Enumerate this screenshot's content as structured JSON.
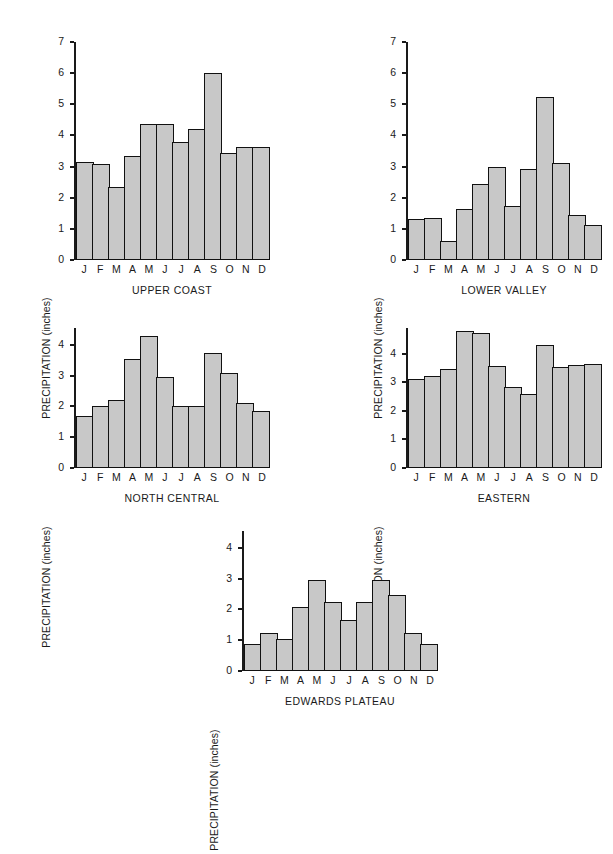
{
  "figure": {
    "ylabel": "PRECIPITATION (inches)",
    "months": [
      "J",
      "F",
      "M",
      "A",
      "M",
      "J",
      "J",
      "A",
      "S",
      "O",
      "N",
      "D"
    ],
    "bar_fill": "#c8c8c8",
    "bar_stroke": "#111111",
    "background": "#ffffff"
  },
  "chart_data": [
    {
      "type": "bar",
      "title": "UPPER COAST",
      "xlabel": "",
      "ylabel": "PRECIPITATION (inches)",
      "categories": [
        "J",
        "F",
        "M",
        "A",
        "M",
        "J",
        "J",
        "A",
        "S",
        "O",
        "N",
        "D"
      ],
      "values": [
        3.15,
        3.08,
        2.33,
        3.33,
        4.38,
        4.38,
        3.78,
        4.2,
        6.0,
        3.43,
        3.62,
        3.62
      ],
      "ylim": [
        0,
        7
      ],
      "yticks": [
        0,
        1,
        2,
        3,
        4,
        5,
        6,
        7
      ],
      "grid": false,
      "legend": "none"
    },
    {
      "type": "bar",
      "title": "LOWER VALLEY",
      "xlabel": "",
      "ylabel": "PRECIPITATION (inches)",
      "categories": [
        "J",
        "F",
        "M",
        "A",
        "M",
        "J",
        "J",
        "A",
        "S",
        "O",
        "N",
        "D"
      ],
      "values": [
        1.33,
        1.35,
        0.62,
        1.65,
        2.45,
        2.98,
        1.75,
        2.92,
        5.22,
        3.1,
        1.43,
        1.12
      ],
      "ylim": [
        0,
        7
      ],
      "yticks": [
        0,
        1,
        2,
        3,
        4,
        5,
        6,
        7
      ],
      "grid": false,
      "legend": "none"
    },
    {
      "type": "bar",
      "title": "NORTH CENTRAL",
      "xlabel": "",
      "ylabel": "PRECIPITATION (inches)",
      "categories": [
        "J",
        "F",
        "M",
        "A",
        "M",
        "J",
        "J",
        "A",
        "S",
        "O",
        "N",
        "D"
      ],
      "values": [
        1.7,
        2.0,
        2.2,
        3.55,
        4.3,
        2.95,
        2.03,
        2.03,
        3.73,
        3.08,
        2.1,
        1.85
      ],
      "ylim": [
        0,
        4.55
      ],
      "yticks": [
        0,
        1,
        2,
        3,
        4
      ],
      "grid": false,
      "legend": "none"
    },
    {
      "type": "bar",
      "title": "EASTERN",
      "xlabel": "",
      "ylabel": "PRECIPITATION (inches)",
      "categories": [
        "J",
        "F",
        "M",
        "A",
        "M",
        "J",
        "J",
        "A",
        "S",
        "O",
        "N",
        "D"
      ],
      "values": [
        3.1,
        3.22,
        3.48,
        4.8,
        4.72,
        3.57,
        2.83,
        2.6,
        4.3,
        3.52,
        3.62,
        3.65
      ],
      "ylim": [
        0,
        4.9
      ],
      "yticks": [
        0,
        1,
        2,
        3,
        4
      ],
      "grid": false,
      "legend": "none"
    },
    {
      "type": "bar",
      "title": "EDWARDS PLATEAU",
      "xlabel": "",
      "ylabel": "PRECIPITATION (inches)",
      "categories": [
        "J",
        "F",
        "M",
        "A",
        "M",
        "J",
        "J",
        "A",
        "S",
        "O",
        "N",
        "D"
      ],
      "values": [
        0.87,
        1.22,
        1.03,
        2.07,
        2.95,
        2.25,
        1.67,
        2.25,
        2.95,
        2.47,
        1.22,
        0.88
      ],
      "ylim": [
        0,
        4.55
      ],
      "yticks": [
        0,
        1,
        2,
        3,
        4
      ],
      "grid": false,
      "legend": "none"
    }
  ]
}
